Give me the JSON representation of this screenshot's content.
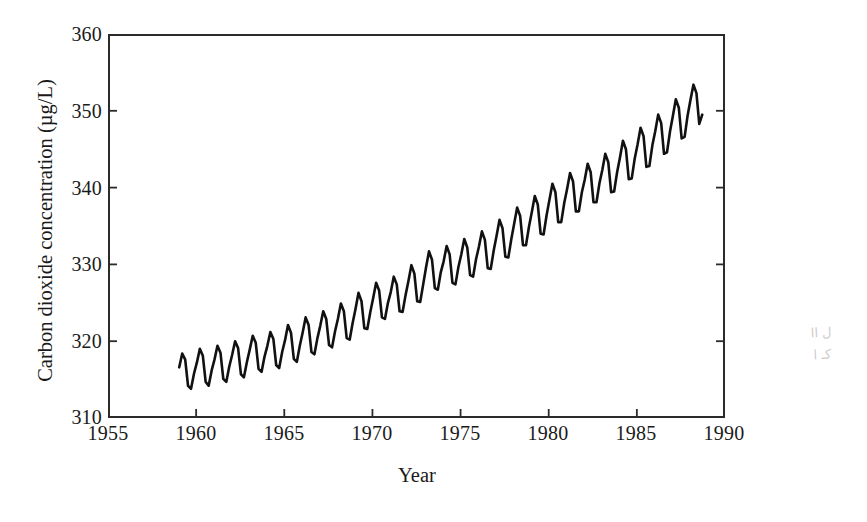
{
  "figure": {
    "background_color": "#ffffff",
    "line_color": "#111111",
    "axis_color": "#2b2b2b"
  },
  "axis_titles": {
    "y": "Carbon dioxide concentration (µg/L)",
    "x": "Year"
  },
  "artifact": {
    "name": "scan-showthrough",
    "line1": "ل اا",
    "line2": "كـ ا"
  },
  "chart_data": {
    "type": "line",
    "title": "",
    "xlabel": "Year",
    "ylabel": "Carbon dioxide concentration (µg/L)",
    "xlim": [
      1955,
      1990
    ],
    "ylim": [
      310,
      360
    ],
    "xticks": [
      1955,
      1960,
      1965,
      1970,
      1975,
      1980,
      1985,
      1990
    ],
    "yticks": [
      310,
      320,
      330,
      340,
      350,
      360
    ],
    "grid": false,
    "legend": null,
    "series": [
      {
        "name": "Atmospheric CO2 concentration",
        "description": "Monthly mean CO2 with annual seasonal oscillation superimposed on a rising trend (Keeling curve).",
        "seasonal_amplitude": 6.0,
        "x": [
          1959.04,
          1959.21,
          1959.38,
          1959.54,
          1959.71,
          1959.88,
          1960.04,
          1960.21,
          1960.38,
          1960.54,
          1960.71,
          1960.88,
          1961.04,
          1961.21,
          1961.38,
          1961.54,
          1961.71,
          1961.88,
          1962.04,
          1962.21,
          1962.38,
          1962.54,
          1962.71,
          1962.88,
          1963.04,
          1963.21,
          1963.38,
          1963.54,
          1963.71,
          1963.88,
          1964.04,
          1964.21,
          1964.38,
          1964.54,
          1964.71,
          1964.88,
          1965.04,
          1965.21,
          1965.38,
          1965.54,
          1965.71,
          1965.88,
          1966.04,
          1966.21,
          1966.38,
          1966.54,
          1966.71,
          1966.88,
          1967.04,
          1967.21,
          1967.38,
          1967.54,
          1967.71,
          1967.88,
          1968.04,
          1968.21,
          1968.38,
          1968.54,
          1968.71,
          1968.88,
          1969.04,
          1969.21,
          1969.38,
          1969.54,
          1969.71,
          1969.88,
          1970.04,
          1970.21,
          1970.38,
          1970.54,
          1970.71,
          1970.88,
          1971.04,
          1971.21,
          1971.38,
          1971.54,
          1971.71,
          1971.88,
          1972.04,
          1972.21,
          1972.38,
          1972.54,
          1972.71,
          1972.88,
          1973.04,
          1973.21,
          1973.38,
          1973.54,
          1973.71,
          1973.88,
          1974.04,
          1974.21,
          1974.38,
          1974.54,
          1974.71,
          1974.88,
          1975.04,
          1975.21,
          1975.38,
          1975.54,
          1975.71,
          1975.88,
          1976.04,
          1976.21,
          1976.38,
          1976.54,
          1976.71,
          1976.88,
          1977.04,
          1977.21,
          1977.38,
          1977.54,
          1977.71,
          1977.88,
          1978.04,
          1978.21,
          1978.38,
          1978.54,
          1978.71,
          1978.88,
          1979.04,
          1979.21,
          1979.38,
          1979.54,
          1979.71,
          1979.88,
          1980.04,
          1980.21,
          1980.38,
          1980.54,
          1980.71,
          1980.88,
          1981.04,
          1981.21,
          1981.38,
          1981.54,
          1981.71,
          1981.88,
          1982.04,
          1982.21,
          1982.38,
          1982.54,
          1982.71,
          1982.88,
          1983.04,
          1983.21,
          1983.38,
          1983.54,
          1983.71,
          1983.88,
          1984.04,
          1984.21,
          1984.38,
          1984.54,
          1984.71,
          1984.88,
          1985.04,
          1985.21,
          1985.38,
          1985.54,
          1985.71,
          1985.88,
          1986.04,
          1986.21,
          1986.38,
          1986.54,
          1986.71,
          1986.88,
          1987.04,
          1987.21,
          1987.38,
          1987.54,
          1987.71,
          1987.88,
          1988.04,
          1988.21,
          1988.38,
          1988.54,
          1988.71
        ],
        "y": [
          316.6,
          318.4,
          317.6,
          314.2,
          313.8,
          315.8,
          317.2,
          319.0,
          318.1,
          314.7,
          314.2,
          316.2,
          317.6,
          319.4,
          318.5,
          315.1,
          314.7,
          316.7,
          318.2,
          320.0,
          319.1,
          315.7,
          315.3,
          317.3,
          318.9,
          320.7,
          319.8,
          316.4,
          316.0,
          318.0,
          319.4,
          321.2,
          320.3,
          316.9,
          316.5,
          318.6,
          320.1,
          322.1,
          321.1,
          317.7,
          317.3,
          319.4,
          321.1,
          323.1,
          322.1,
          318.6,
          318.3,
          320.4,
          322.0,
          323.9,
          322.9,
          319.5,
          319.2,
          321.3,
          322.9,
          324.9,
          323.9,
          320.4,
          320.2,
          322.4,
          324.2,
          326.3,
          325.2,
          321.7,
          321.6,
          323.8,
          325.6,
          327.6,
          326.6,
          323.1,
          322.9,
          325.0,
          326.4,
          328.4,
          327.4,
          323.9,
          323.8,
          326.0,
          327.8,
          329.9,
          328.8,
          325.2,
          325.1,
          327.4,
          329.6,
          331.7,
          330.6,
          326.9,
          326.7,
          329.0,
          330.4,
          332.4,
          331.3,
          327.6,
          327.4,
          329.7,
          331.3,
          333.3,
          332.2,
          328.6,
          328.4,
          330.7,
          332.3,
          334.3,
          333.2,
          329.5,
          329.4,
          331.8,
          333.7,
          335.8,
          334.7,
          331.0,
          330.9,
          333.3,
          335.3,
          337.4,
          336.3,
          332.5,
          332.5,
          334.9,
          336.8,
          338.9,
          337.8,
          334.0,
          333.9,
          336.4,
          338.4,
          340.5,
          339.4,
          335.5,
          335.5,
          338.0,
          339.8,
          341.9,
          340.8,
          336.9,
          336.9,
          339.4,
          341.0,
          343.1,
          342.0,
          338.1,
          338.1,
          340.6,
          342.3,
          344.4,
          343.3,
          339.4,
          339.5,
          342.0,
          343.9,
          346.1,
          345.0,
          341.1,
          341.2,
          343.8,
          345.6,
          347.8,
          346.7,
          342.7,
          342.8,
          345.5,
          347.3,
          349.5,
          348.4,
          344.4,
          344.6,
          347.3,
          349.3,
          351.5,
          350.4,
          346.4,
          346.6,
          349.4,
          351.4,
          353.4,
          352.3,
          348.3,
          349.5
        ]
      }
    ]
  }
}
